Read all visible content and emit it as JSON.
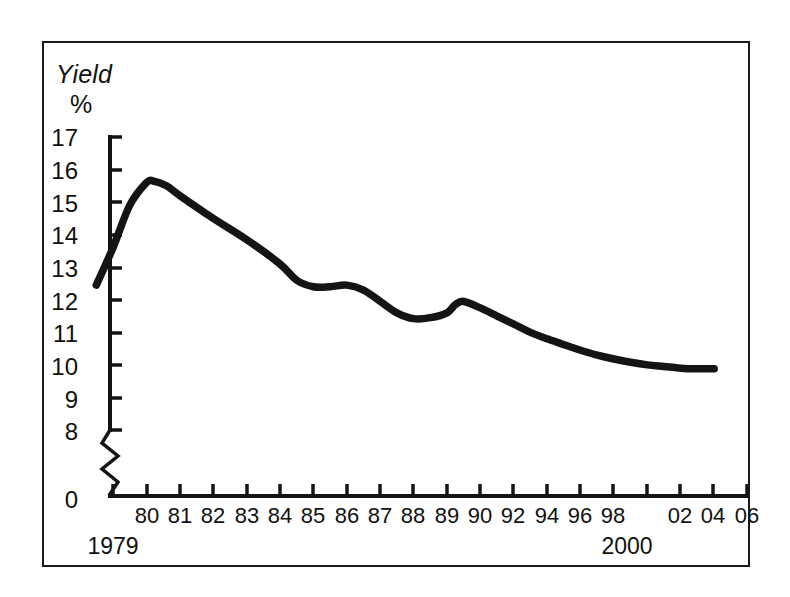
{
  "figure": {
    "background": "#ffffff",
    "frame_color": "#1a1a1a",
    "line_color": "#141414"
  },
  "axis": {
    "y_title_line1": "Yield",
    "y_title_line2": "%",
    "y_ticks": [
      "17",
      "16",
      "15",
      "14",
      "13",
      "12",
      "11",
      "10",
      "9",
      "8",
      "0"
    ],
    "y_break_between": [
      "8",
      "0"
    ],
    "x_ticks": [
      "80",
      "81",
      "82",
      "83",
      "84",
      "85",
      "86",
      "87",
      "88",
      "89",
      "90",
      "92",
      "94",
      "96",
      "98",
      "02",
      "04",
      "06"
    ],
    "x_major_labels": [
      "1979",
      "2000"
    ]
  },
  "chart_data": {
    "type": "line",
    "title": "",
    "subtitle": "",
    "xlabel": "",
    "ylabel": "Yield %",
    "ylim": [
      8,
      17
    ],
    "y_break": [
      0,
      8
    ],
    "xlim": [
      1979.5,
      2006.5
    ],
    "grid": false,
    "legend": null,
    "y_ticks": [
      8,
      9,
      10,
      11,
      12,
      13,
      14,
      15,
      16,
      17
    ],
    "x_tick_years": [
      1980,
      1981,
      1982,
      1983,
      1984,
      1985,
      1986,
      1987,
      1988,
      1989,
      1990,
      1992,
      1994,
      1996,
      1998,
      2000,
      2002,
      2004,
      2006
    ],
    "series": [
      {
        "name": "Yield",
        "x": [
          1979.5,
          1980.0,
          1980.5,
          1981.0,
          1981.2,
          1981.6,
          1982.0,
          1983.0,
          1984.0,
          1985.0,
          1985.5,
          1986.0,
          1986.5,
          1987.0,
          1987.5,
          1988.0,
          1988.5,
          1989.0,
          1989.5,
          1990.0,
          1990.5,
          1991.0,
          1992.0,
          1993.0,
          1994.0,
          1995.0,
          1996.0,
          1997.0,
          1998.0,
          1999.0,
          2000.0,
          2001.0,
          2002.0,
          2003.0,
          2004.0,
          2005.0,
          2006.0
        ],
        "y": [
          12.45,
          13.6,
          14.9,
          15.6,
          15.65,
          15.5,
          15.2,
          14.5,
          13.85,
          13.1,
          12.6,
          12.4,
          12.4,
          12.45,
          12.3,
          11.95,
          11.6,
          11.42,
          11.45,
          11.6,
          11.85,
          11.95,
          11.75,
          11.5,
          11.25,
          11.0,
          10.8,
          10.62,
          10.45,
          10.3,
          10.18,
          10.08,
          10.0,
          9.95,
          9.9,
          9.88,
          9.88
        ]
      }
    ]
  }
}
